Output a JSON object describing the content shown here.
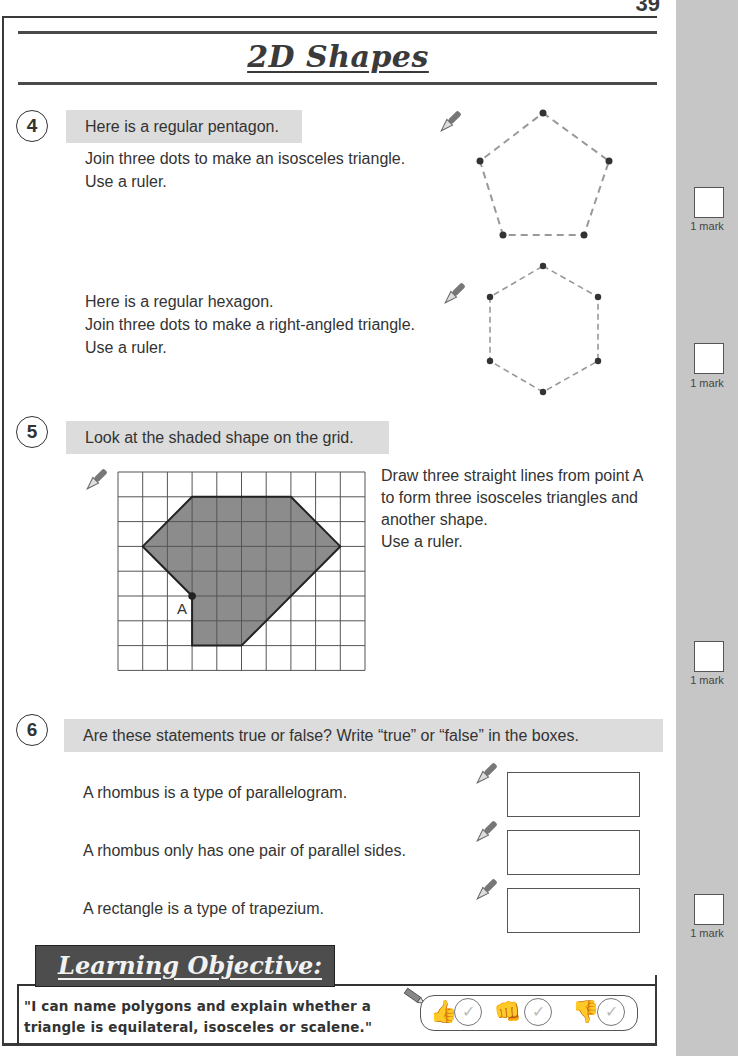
{
  "page": {
    "number": "39",
    "title": "2D Shapes"
  },
  "questions": [
    {
      "number": "4",
      "band": "Here is a regular pentagon.",
      "lines": [
        "Join three dots to make an isosceles triangle.",
        "Use a ruler."
      ],
      "shape": "regular-pentagon"
    },
    {
      "number": "",
      "lines": [
        "Here is a regular hexagon.",
        "Join three dots to make a right-angled triangle.",
        "Use a ruler."
      ],
      "shape": "regular-hexagon"
    },
    {
      "number": "5",
      "band": "Look at the shaded shape on the grid.",
      "lines": [
        "Draw three straight lines from point A",
        "to form three isosceles triangles and",
        "another shape.",
        "Use a ruler."
      ],
      "grid": {
        "columns": 10,
        "rows": 8,
        "point_label": "A",
        "shape_vertices": [
          [
            3,
            1
          ],
          [
            7,
            1
          ],
          [
            9,
            3
          ],
          [
            5,
            7
          ],
          [
            3,
            7
          ],
          [
            3,
            5
          ],
          [
            1,
            3
          ]
        ]
      }
    },
    {
      "number": "6",
      "band": "Are these statements true or false?  Write “true” or “false” in the boxes.",
      "statements": [
        {
          "text": "A rhombus is a type of parallelogram.",
          "answer": ""
        },
        {
          "text": "A rhombus only has one pair of parallel sides.",
          "answer": ""
        },
        {
          "text": "A rectangle is a type of trapezium.",
          "answer": ""
        }
      ]
    }
  ],
  "marks": [
    {
      "label": "1 mark"
    },
    {
      "label": "1 mark"
    },
    {
      "label": "1 mark"
    },
    {
      "label": "1 mark"
    }
  ],
  "learning_objective": {
    "heading": "Learning Objective:",
    "text_line1": "\"I can name polygons and explain whether a",
    "text_line2": "triangle is equilateral, isosceles or scalene.\"",
    "self_assessment": [
      {
        "icon": "thumbs-up-icon",
        "glyph": "👍",
        "check": "✓"
      },
      {
        "icon": "thumbs-sideways-icon",
        "glyph": "👊",
        "check": "✓"
      },
      {
        "icon": "thumbs-down-icon",
        "glyph": "👎",
        "check": "✓"
      }
    ]
  },
  "colors": {
    "sidebar": "#c6c6c6",
    "band": "#dcdcdc",
    "shape_fill": "#8c8c8c",
    "frame": "#3a3a3a",
    "banner": "#4d4d4d"
  }
}
